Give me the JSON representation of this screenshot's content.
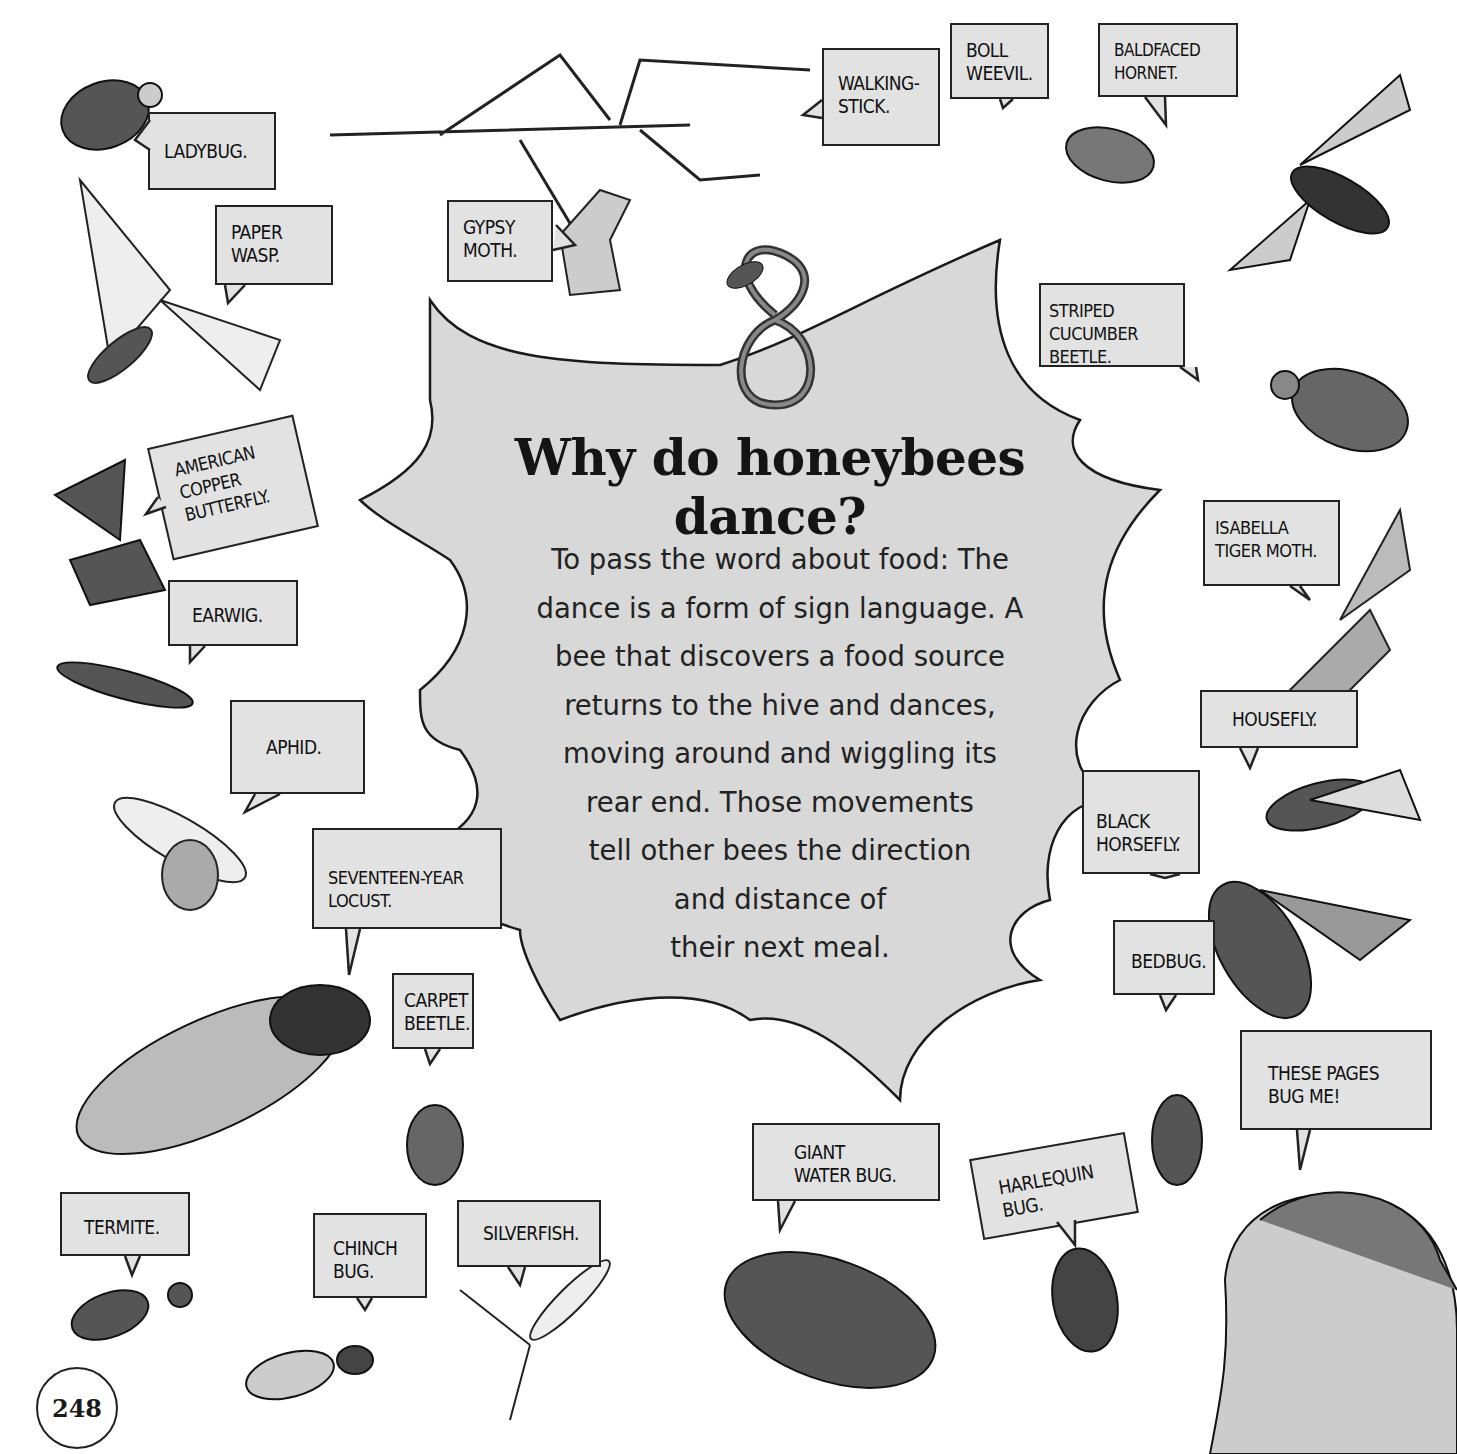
{
  "page": {
    "title": "Why do honeybees dance?",
    "answer_lines": [
      "To pass the word about food: The",
      "dance is a form of sign language. A",
      "bee that discovers a food source",
      "returns to the hive and dances,",
      "moving around and wiggling its",
      "rear end. Those movements",
      "tell other bees the direction",
      "and distance of",
      "their next meal."
    ],
    "page_number": "248"
  },
  "labels": {
    "ladybug": "LADYBUG.",
    "paper_wasp": "PAPER\nWASP.",
    "gypsy_moth": "GYPSY\nMOTH.",
    "walking_stick": "WALKING-\nSTICK.",
    "boll_weevil": "BOLL\nWEEVIL.",
    "baldfaced_hornet": "BALDFACED\nHORNET.",
    "striped_cucumber_beetle": "STRIPED\nCUCUMBER BEETLE.",
    "american_copper_butterfly": "AMERICAN\nCOPPER\nBUTTERFLY.",
    "earwig": "EARWIG.",
    "aphid": "APHID.",
    "seventeen_year_locust": "SEVENTEEN-YEAR\nLOCUST.",
    "carpet_beetle": "CARPET\nBEETLE.",
    "isabella_tiger_moth": "ISABELLA\nTIGER MOTH.",
    "housefly": "HOUSEFLY.",
    "black_horsefly": "BLACK\nHORSEFLY.",
    "bedbug": "BEDBUG.",
    "these_pages": "THESE PAGES\nBUG ME!",
    "giant_water_bug": "GIANT\nWATER BUG.",
    "harlequin_bug": "HARLEQUIN\nBUG.",
    "termite": "TERMITE.",
    "chinch_bug": "CHINCH\nBUG.",
    "silverfish": "SILVERFISH."
  },
  "colors": {
    "burst_fill": "#d8d8d8",
    "label_fill": "#e2e2e2",
    "ink": "#1a1a1a"
  }
}
